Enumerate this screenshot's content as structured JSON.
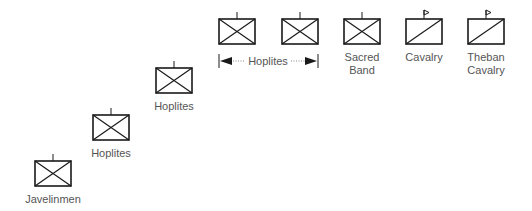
{
  "colors": {
    "stroke": "#1a1a1a",
    "label": "#555555",
    "dots": "#888888"
  },
  "units": [
    {
      "id": "javelinmen",
      "type": "infantry",
      "label": [
        "Javelinmen"
      ]
    },
    {
      "id": "hoplites-1",
      "type": "infantry",
      "label": [
        "Hoplites"
      ]
    },
    {
      "id": "hoplites-2",
      "type": "infantry",
      "label": [
        "Hoplites"
      ]
    },
    {
      "id": "hoplites-3",
      "type": "infantry",
      "label": []
    },
    {
      "id": "hoplites-4",
      "type": "infantry",
      "label": []
    },
    {
      "id": "sacred-band",
      "type": "infantry",
      "label": [
        "Sacred",
        "Band"
      ]
    },
    {
      "id": "cavalry",
      "type": "cavalry",
      "label": [
        "Cavalry"
      ]
    },
    {
      "id": "theban-cavalry",
      "type": "cavalry",
      "label": [
        "Theban",
        "Cavalry"
      ]
    }
  ],
  "span_label": "Hoplites"
}
